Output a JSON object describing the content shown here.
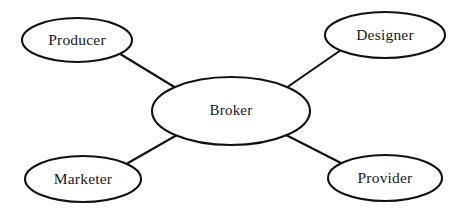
{
  "diagram": {
    "type": "node-link-graph",
    "background_color": "#ffffff",
    "stroke_color": "#111111",
    "text_color": "#17171a",
    "fill_color": "#ffffff",
    "stroke_width": 2.1,
    "nodes": [
      {
        "id": "producer",
        "label": "Producer",
        "role": "peripheral",
        "cx": 77,
        "cy": 40,
        "rx": 55,
        "ry": 22
      },
      {
        "id": "designer",
        "label": "Designer",
        "role": "peripheral",
        "cx": 385,
        "cy": 35,
        "rx": 60,
        "ry": 23
      },
      {
        "id": "broker",
        "label": "Broker",
        "role": "hub",
        "cx": 231,
        "cy": 111,
        "rx": 79,
        "ry": 34
      },
      {
        "id": "marketer",
        "label": "Marketer",
        "role": "peripheral",
        "cx": 83,
        "cy": 179,
        "rx": 58,
        "ry": 23
      },
      {
        "id": "provider",
        "label": "Provider",
        "role": "peripheral",
        "cx": 385,
        "cy": 178,
        "rx": 57,
        "ry": 23
      }
    ],
    "edges": [
      {
        "id": "edge-producer-broker",
        "from": "producer",
        "to": "broker",
        "x1": 117,
        "y1": 52,
        "x2": 176,
        "y2": 88
      },
      {
        "id": "edge-designer-broker",
        "from": "designer",
        "to": "broker",
        "x1": 341,
        "y1": 50,
        "x2": 286,
        "y2": 88
      },
      {
        "id": "edge-marketer-broker",
        "from": "marketer",
        "to": "broker",
        "x1": 128,
        "y1": 163,
        "x2": 177,
        "y2": 135
      },
      {
        "id": "edge-provider-broker",
        "from": "provider",
        "to": "broker",
        "x1": 341,
        "y1": 163,
        "x2": 286,
        "y2": 135
      }
    ]
  }
}
